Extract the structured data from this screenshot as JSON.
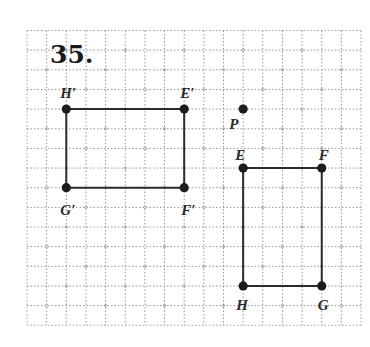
{
  "problem": {
    "number": "35."
  },
  "grid": {
    "origin_x": 27,
    "origin_y": 30.5,
    "cell": 19.65,
    "cols": 17,
    "rows": 15,
    "line_color": "#8a8a8a"
  },
  "figures": {
    "image": {
      "name": "rectangle E'F'G'H'",
      "vertices": [
        {
          "label": "H′",
          "col": 2,
          "row": 4,
          "label_dx": -6,
          "label_dy": -11
        },
        {
          "label": "E′",
          "col": 8,
          "row": 4,
          "label_dx": -4,
          "label_dy": -11
        },
        {
          "label": "F′",
          "col": 8,
          "row": 8,
          "label_dx": -3,
          "label_dy": 27
        },
        {
          "label": "G′",
          "col": 2,
          "row": 8,
          "label_dx": -6,
          "label_dy": 27
        }
      ]
    },
    "preimage": {
      "name": "rectangle EFGH",
      "vertices": [
        {
          "label": "E",
          "col": 11,
          "row": 7,
          "label_dx": -8,
          "label_dy": -8
        },
        {
          "label": "F",
          "col": 15,
          "row": 7,
          "label_dx": -3,
          "label_dy": -8
        },
        {
          "label": "G",
          "col": 15,
          "row": 13,
          "label_dx": -4,
          "label_dy": 24
        },
        {
          "label": "H",
          "col": 11,
          "row": 13,
          "label_dx": -7,
          "label_dy": 24
        }
      ]
    },
    "center": {
      "label": "P",
      "col": 11,
      "row": 4,
      "label_dx": -14,
      "label_dy": 20
    }
  },
  "colors": {
    "ink": "#1c1c1c",
    "grid": "#8a8a8a",
    "background": "#ffffff"
  }
}
